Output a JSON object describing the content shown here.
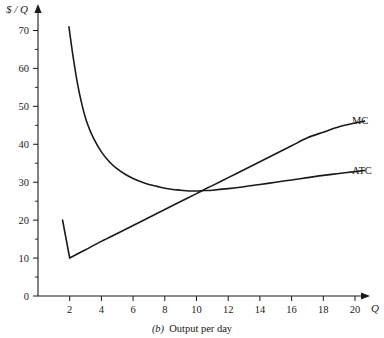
{
  "chart_data": {
    "type": "line",
    "title": "",
    "caption_tag": "(b)",
    "caption_label": "Output per day",
    "xlabel": "Q",
    "ylabel": "$ / Q",
    "xlim": [
      0,
      21.5
    ],
    "ylim": [
      0,
      75
    ],
    "grid": false,
    "legend_position": "right-inline",
    "x_ticks_major": [
      2,
      4,
      6,
      8,
      10,
      12,
      14,
      16,
      18,
      20
    ],
    "x_ticks_minor": [
      1,
      3,
      5,
      7,
      9,
      11,
      13,
      15,
      17,
      19,
      21
    ],
    "y_ticks_major": [
      0,
      10,
      20,
      30,
      40,
      50,
      60,
      70
    ],
    "y_ticks_minor": [
      5,
      15,
      25,
      35,
      45,
      55,
      65
    ],
    "series": [
      {
        "name": "MC",
        "label": "MC",
        "color": "#1a1a1a",
        "points": [
          [
            1.55,
            20.0
          ],
          [
            1.78,
            14.9
          ],
          [
            2.0,
            10.0
          ],
          [
            3.0,
            12.2
          ],
          [
            4.0,
            14.4
          ],
          [
            5.0,
            16.5
          ],
          [
            6.0,
            18.6
          ],
          [
            7.0,
            20.7
          ],
          [
            8.0,
            22.8
          ],
          [
            9.0,
            24.9
          ],
          [
            10.0,
            27.0
          ],
          [
            10.5,
            28.1
          ],
          [
            11.0,
            29.1
          ],
          [
            12.0,
            31.2
          ],
          [
            13.0,
            33.3
          ],
          [
            14.0,
            35.4
          ],
          [
            15.0,
            37.5
          ],
          [
            16.0,
            39.6
          ],
          [
            17.0,
            41.7
          ],
          [
            18.0,
            43.2
          ],
          [
            19.0,
            44.6
          ],
          [
            20.0,
            45.6
          ],
          [
            20.6,
            46.1
          ]
        ]
      },
      {
        "name": "ATC",
        "label": "ATC",
        "color": "#1a1a1a",
        "points": [
          [
            1.95,
            71.0
          ],
          [
            2.2,
            63.5
          ],
          [
            2.5,
            55.8
          ],
          [
            2.8,
            50.0
          ],
          [
            3.1,
            45.6
          ],
          [
            3.5,
            41.6
          ],
          [
            4.0,
            38.0
          ],
          [
            4.5,
            35.4
          ],
          [
            5.0,
            33.5
          ],
          [
            5.5,
            32.1
          ],
          [
            6.0,
            31.0
          ],
          [
            6.5,
            30.1
          ],
          [
            7.0,
            29.4
          ],
          [
            7.5,
            28.9
          ],
          [
            8.0,
            28.4
          ],
          [
            8.5,
            28.1
          ],
          [
            9.0,
            27.9
          ],
          [
            9.5,
            27.7
          ],
          [
            10.0,
            27.7
          ],
          [
            10.5,
            27.8
          ],
          [
            11.0,
            27.9
          ],
          [
            12.0,
            28.3
          ],
          [
            13.0,
            28.8
          ],
          [
            14.0,
            29.4
          ],
          [
            15.0,
            30.0
          ],
          [
            16.0,
            30.6
          ],
          [
            17.0,
            31.2
          ],
          [
            18.0,
            31.8
          ],
          [
            19.0,
            32.3
          ],
          [
            20.0,
            32.8
          ],
          [
            20.6,
            33.1
          ]
        ]
      }
    ],
    "annotations": [
      {
        "name": "mc-minimum",
        "x": 2,
        "y": 10
      },
      {
        "name": "atc-minimum",
        "x": 9.7,
        "y": 27.7
      },
      {
        "name": "mc-atc-intersection",
        "x": 10.6,
        "y": 28.1
      }
    ]
  },
  "colors": {
    "ink": "#1a1a1a",
    "background": "#ffffff"
  }
}
